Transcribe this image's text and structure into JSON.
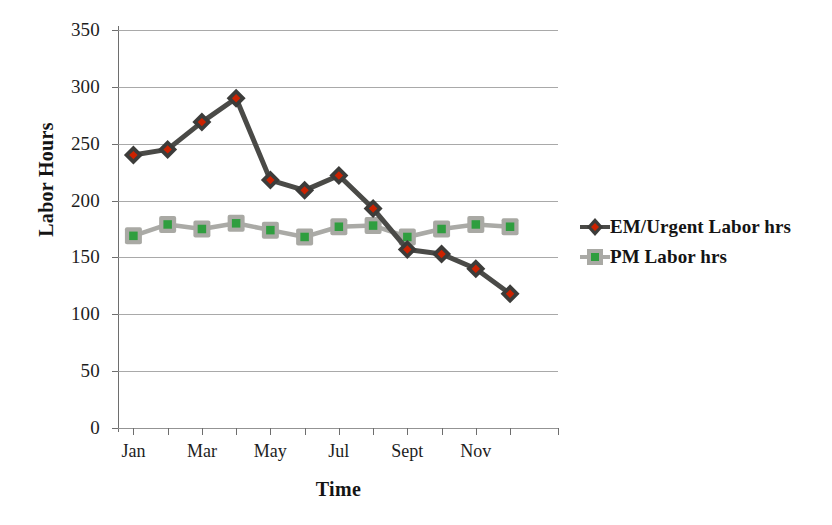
{
  "chart_data": {
    "type": "line",
    "title": "",
    "xlabel": "Time",
    "ylabel": "Labor Hours",
    "ylim": [
      0,
      350
    ],
    "yticks": [
      0,
      50,
      100,
      150,
      200,
      250,
      300,
      350
    ],
    "ytick_labels": [
      "0",
      "50",
      "100",
      "150",
      "200",
      "250",
      "300",
      "350"
    ],
    "grid": true,
    "legend_position": "right",
    "categories": [
      "Jan",
      "Feb",
      "Mar",
      "Apr",
      "May",
      "Jun",
      "Jul",
      "Aug",
      "Sept",
      "Oct",
      "Nov",
      "Dec"
    ],
    "xtick_labels": [
      "Jan",
      "",
      "Mar",
      "",
      "May",
      "",
      "Jul",
      "",
      "Sept",
      "",
      "Nov",
      ""
    ],
    "xtick_labels_visible": [
      "Jan",
      "Mar",
      "May",
      "Jul",
      "Sept",
      "Nov"
    ],
    "series": [
      {
        "name": "EM/Urgent Labor hrs",
        "marker": "diamond",
        "line_color": "#4a4a47",
        "marker_fill": "#cc2200",
        "marker_edge": "#3c3c3a",
        "values": [
          240,
          245,
          269,
          290,
          218,
          209,
          222,
          193,
          157,
          153,
          140,
          118
        ]
      },
      {
        "name": "PM Labor hrs",
        "marker": "square",
        "line_color": "#aaaaa6",
        "marker_fill": "#2f9e3f",
        "marker_edge": "#a9a9a4",
        "values": [
          169,
          179,
          175,
          180,
          174,
          168,
          177,
          178,
          168,
          175,
          179,
          177
        ]
      }
    ]
  },
  "legend": {
    "items": [
      {
        "label": "EM/Urgent Labor hrs"
      },
      {
        "label": "PM Labor hrs"
      }
    ]
  },
  "colors": {
    "em_line": "#4a4a47",
    "em_marker": "#cc2200",
    "pm_line": "#aaaaa6",
    "pm_marker": "#2f9e3f",
    "gridline": "#9a9a9a",
    "axis": "#6e6e6e",
    "text": "#1a1a1a",
    "background": "#ffffff"
  }
}
